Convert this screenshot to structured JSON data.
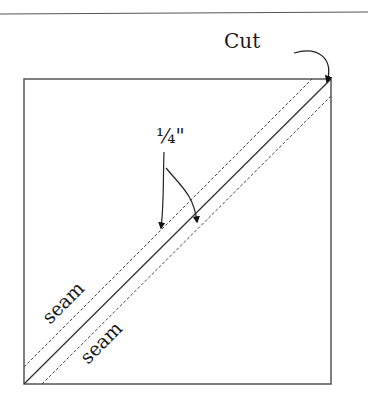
{
  "diagram": {
    "labels": {
      "cut": "Cut",
      "quarter_inch": "¼\"",
      "seam_upper": "seam",
      "seam_lower": "seam"
    },
    "colors": {
      "line": "#333333",
      "background": "#ffffff"
    }
  }
}
